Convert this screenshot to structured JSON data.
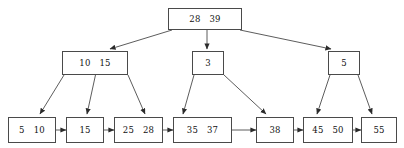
{
  "diagram": {
    "type": "tree",
    "stroke_color": "#4a4a4a",
    "text_color": "#111111",
    "background": "#ffffff",
    "levels": [
      {
        "level": 0,
        "name": "root",
        "nodes": [
          {
            "id": "root",
            "keys": [
              "28",
              "39"
            ],
            "x": 168,
            "y": 8,
            "w": 74,
            "h": 22
          }
        ]
      },
      {
        "level": 1,
        "name": "internal",
        "nodes": [
          {
            "id": "internal-left",
            "keys": [
              "10",
              "15"
            ],
            "x": 62,
            "y": 51,
            "w": 66,
            "h": 24
          },
          {
            "id": "internal-middle",
            "keys": [
              "3"
            ],
            "x": 192,
            "y": 51,
            "w": 32,
            "h": 24
          },
          {
            "id": "internal-right",
            "keys": [
              "5"
            ],
            "x": 328,
            "y": 51,
            "w": 32,
            "h": 24
          }
        ]
      },
      {
        "level": 2,
        "name": "leaves",
        "nodes": [
          {
            "id": "leaf-1",
            "keys": [
              "5",
              "10"
            ],
            "x": 8,
            "y": 117,
            "w": 48,
            "h": 26
          },
          {
            "id": "leaf-2",
            "keys": [
              "15"
            ],
            "x": 66,
            "y": 117,
            "w": 38,
            "h": 26
          },
          {
            "id": "leaf-3",
            "keys": [
              "25",
              "28"
            ],
            "x": 114,
            "y": 117,
            "w": 49,
            "h": 26
          },
          {
            "id": "leaf-4",
            "keys": [
              "35",
              "37"
            ],
            "x": 173,
            "y": 117,
            "w": 59,
            "h": 26
          },
          {
            "id": "leaf-5",
            "keys": [
              "38"
            ],
            "x": 256,
            "y": 117,
            "w": 38,
            "h": 26
          },
          {
            "id": "leaf-6",
            "keys": [
              "45",
              "50"
            ],
            "x": 303,
            "y": 117,
            "w": 50,
            "h": 26
          },
          {
            "id": "leaf-7",
            "keys": [
              "55"
            ],
            "x": 361,
            "y": 117,
            "w": 36,
            "h": 26
          }
        ]
      }
    ],
    "child_edges": [
      {
        "from": "root",
        "to": "internal-left",
        "x1": 172,
        "y1": 30,
        "x2": 110,
        "y2": 49
      },
      {
        "from": "root",
        "to": "internal-middle",
        "x1": 207,
        "y1": 30,
        "x2": 207,
        "y2": 49
      },
      {
        "from": "root",
        "to": "internal-right",
        "x1": 240,
        "y1": 30,
        "x2": 331,
        "y2": 49
      },
      {
        "from": "internal-left",
        "to": "leaf-1",
        "x1": 64,
        "y1": 75,
        "x2": 40,
        "y2": 114
      },
      {
        "from": "internal-left",
        "to": "leaf-2",
        "x1": 97,
        "y1": 68,
        "x2": 87,
        "y2": 114
      },
      {
        "from": "internal-left",
        "to": "leaf-3",
        "x1": 128,
        "y1": 75,
        "x2": 145,
        "y2": 114
      },
      {
        "from": "internal-middle",
        "to": "leaf-4",
        "x1": 194,
        "y1": 75,
        "x2": 183,
        "y2": 114
      },
      {
        "from": "internal-middle",
        "to": "leaf-5",
        "x1": 224,
        "y1": 75,
        "x2": 266,
        "y2": 114
      },
      {
        "from": "internal-right",
        "to": "leaf-6",
        "x1": 330,
        "y1": 75,
        "x2": 317,
        "y2": 114
      },
      {
        "from": "internal-right",
        "to": "leaf-7",
        "x1": 358,
        "y1": 75,
        "x2": 372,
        "y2": 114
      }
    ],
    "leaf_links": [
      {
        "from": "leaf-1",
        "to": "leaf-2",
        "x1": 56,
        "x2": 66,
        "y": 130
      },
      {
        "from": "leaf-2",
        "to": "leaf-3",
        "x1": 104,
        "x2": 114,
        "y": 130
      },
      {
        "from": "leaf-3",
        "to": "leaf-4",
        "x1": 163,
        "x2": 173,
        "y": 130
      },
      {
        "from": "leaf-4",
        "to": "leaf-5",
        "x1": 232,
        "x2": 256,
        "y": 130
      },
      {
        "from": "leaf-5",
        "to": "leaf-6",
        "x1": 294,
        "x2": 303,
        "y": 130
      },
      {
        "from": "leaf-6",
        "to": "leaf-7",
        "x1": 353,
        "x2": 361,
        "y": 130
      }
    ]
  }
}
